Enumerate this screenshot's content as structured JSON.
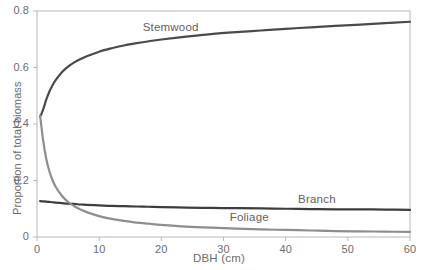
{
  "chart_data": {
    "type": "line",
    "title": "",
    "xlabel": "DBH (cm)",
    "ylabel": "Proportion of total biomass",
    "xlim": [
      0,
      60
    ],
    "ylim": [
      0,
      0.8
    ],
    "xticks": [
      0,
      10,
      20,
      30,
      40,
      50,
      60
    ],
    "xtick_labels": [
      "0",
      "10",
      "20",
      "30",
      "40",
      "50",
      "60"
    ],
    "yticks": [
      0,
      0.2,
      0.4,
      0.6,
      0.8
    ],
    "ytick_labels": [
      "0",
      "0.2",
      "0.4",
      "0.6",
      "0.8"
    ],
    "grid": false,
    "legend_position": "inline-annotations",
    "frame": true,
    "x": [
      0.5,
      1,
      1.5,
      2,
      2.5,
      3,
      4,
      5,
      6,
      7,
      8,
      10,
      12,
      14,
      16,
      18,
      20,
      24,
      28,
      32,
      36,
      40,
      44,
      48,
      52,
      56,
      60
    ],
    "series": [
      {
        "name": "Stemwood",
        "color": "#4a4a4a",
        "label_x": 17,
        "label_y": 0.735,
        "values": [
          0.425,
          0.452,
          0.487,
          0.515,
          0.537,
          0.555,
          0.583,
          0.603,
          0.618,
          0.63,
          0.64,
          0.656,
          0.668,
          0.678,
          0.686,
          0.693,
          0.699,
          0.709,
          0.718,
          0.725,
          0.731,
          0.737,
          0.742,
          0.747,
          0.752,
          0.757,
          0.762
        ]
      },
      {
        "name": "Branch",
        "color": "#3d3d3d",
        "label_x": 42,
        "label_y": 0.128,
        "values": [
          0.127,
          0.126,
          0.125,
          0.124,
          0.123,
          0.122,
          0.12,
          0.118,
          0.117,
          0.115,
          0.114,
          0.112,
          0.11,
          0.109,
          0.108,
          0.107,
          0.106,
          0.104,
          0.103,
          0.102,
          0.101,
          0.1,
          0.099,
          0.098,
          0.098,
          0.097,
          0.096
        ]
      },
      {
        "name": "Foliage",
        "color": "#8e8e8e",
        "label_x": 31,
        "label_y": 0.063,
        "values": [
          0.43,
          0.34,
          0.275,
          0.232,
          0.201,
          0.178,
          0.146,
          0.124,
          0.109,
          0.097,
          0.088,
          0.074,
          0.064,
          0.057,
          0.051,
          0.047,
          0.043,
          0.037,
          0.033,
          0.03,
          0.027,
          0.025,
          0.023,
          0.021,
          0.02,
          0.019,
          0.018
        ]
      }
    ]
  },
  "axes": {
    "y_title": "Proportion of total biomass",
    "x_title": "DBH (cm)"
  },
  "labels": {
    "stemwood": "Stemwood",
    "branch": "Branch",
    "foliage": "Foliage"
  },
  "colors": {
    "stemwood": "#4a4a4a",
    "branch": "#3d3d3d",
    "foliage": "#8e8e8e",
    "frame": "#b8b8b8",
    "text": "#6b6b6b"
  }
}
